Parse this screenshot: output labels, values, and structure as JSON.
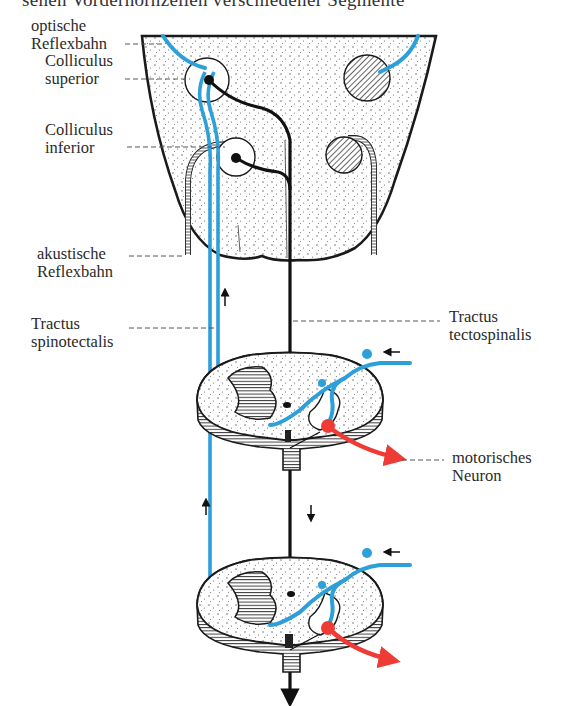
{
  "figure": {
    "caption_fragment": "sehen Vorderhornzellen verschiedener Segmente",
    "colors": {
      "afferent_blue": "#2d9fd9",
      "motor_red": "#ee3b36",
      "outline": "#1a1a1a",
      "stipple": "#555555"
    },
    "labels": {
      "optische_reflexbahn": [
        "optische",
        "Reflexbahn"
      ],
      "colliculus_superior": [
        "Colliculus",
        "superior"
      ],
      "colliculus_inferior": [
        "Colliculus",
        "inferior"
      ],
      "akustische_reflexbahn": [
        "akustische",
        "Reflexbahn"
      ],
      "tractus_spinotectalis": [
        "Tractus",
        "spinotectalis"
      ],
      "tractus_tectospinalis": [
        "Tractus",
        "tectospinalis"
      ],
      "motorisches_neuron": [
        "motorisches",
        "Neuron"
      ]
    },
    "structures": [
      "brainstem-midbrain",
      "colliculus-superior-left",
      "colliculus-superior-right",
      "colliculus-inferior-left",
      "colliculus-inferior-right",
      "spinal-cord-section-upper",
      "spinal-cord-section-lower"
    ]
  }
}
